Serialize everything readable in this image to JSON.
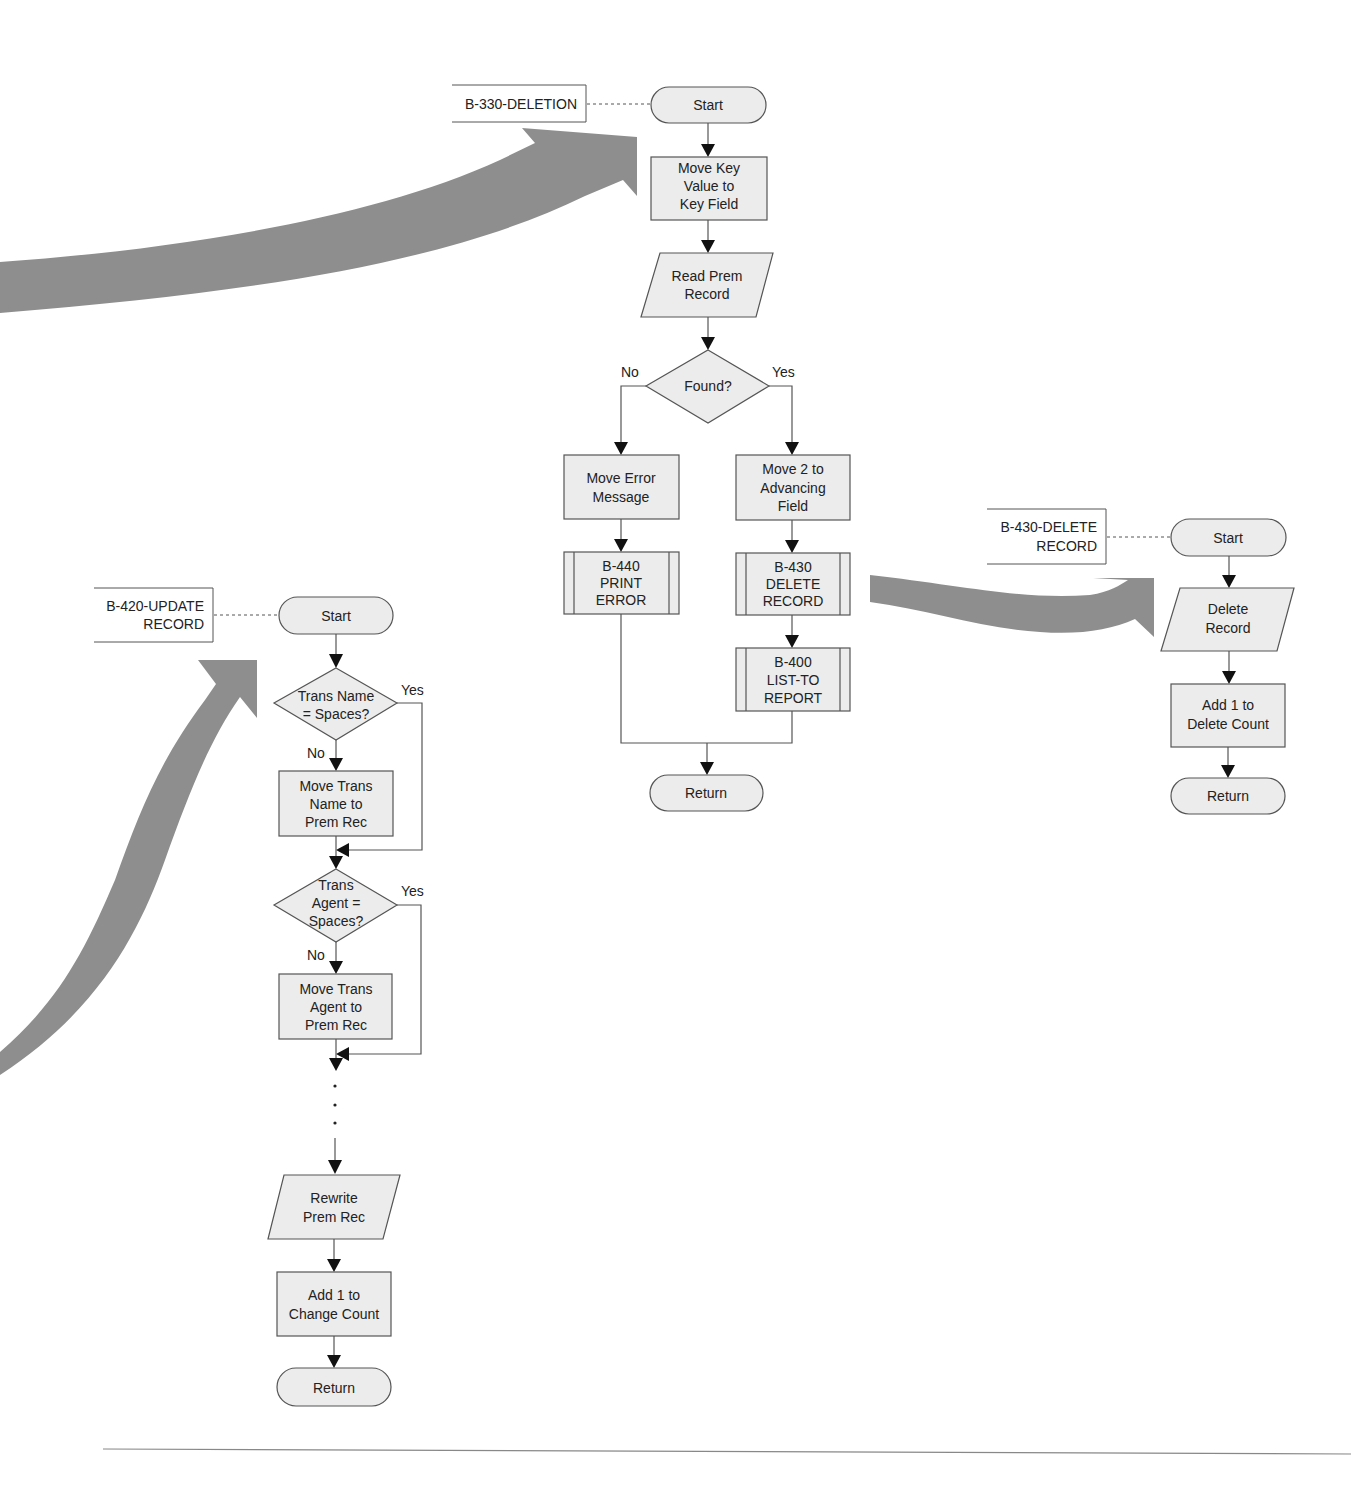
{
  "colors": {
    "shape_fill": "#ececec",
    "stroke": "#555555",
    "connector_arrow": "#8e8e8e"
  },
  "flowcharts": {
    "deletion": {
      "name_lines": [
        "B-330-DELETION"
      ],
      "start": "Start",
      "move_key": [
        "Move Key",
        "Value to",
        "Key Field"
      ],
      "read_prem": [
        "Read Prem",
        "Record"
      ],
      "decision": [
        "Found?"
      ],
      "no_label": "No",
      "yes_label": "Yes",
      "move_error": [
        "Move Error",
        "Message"
      ],
      "print_error": [
        "B-440",
        "PRINT",
        "ERROR"
      ],
      "move_two": [
        "Move 2 to",
        "Advancing",
        "Field"
      ],
      "delete_record_call": [
        "B-430",
        "DELETE",
        "RECORD"
      ],
      "list_to_report": [
        "B-400",
        "LIST-TO",
        "REPORT"
      ],
      "return": "Return"
    },
    "delete_record": {
      "name_lines": [
        "B-430-DELETE",
        "RECORD"
      ],
      "start": "Start",
      "delete": [
        "Delete",
        "Record"
      ],
      "add_count": [
        "Add 1 to",
        "Delete Count"
      ],
      "return": "Return"
    },
    "update_record": {
      "name_lines": [
        "B-420-UPDATE",
        "RECORD"
      ],
      "start": "Start",
      "decision_name": [
        "Trans Name",
        "= Spaces?"
      ],
      "yes_label_1": "Yes",
      "no_label_1": "No",
      "move_name": [
        "Move Trans",
        "Name to",
        "Prem Rec"
      ],
      "decision_agent": [
        "Trans",
        "Agent =",
        "Spaces?"
      ],
      "yes_label_2": "Yes",
      "no_label_2": "No",
      "move_agent": [
        "Move Trans",
        "Agent to",
        "Prem Rec"
      ],
      "continuation": "...",
      "rewrite": [
        "Rewrite",
        "Prem Rec"
      ],
      "add_count": [
        "Add 1 to",
        "Change Count"
      ],
      "return": "Return"
    }
  }
}
